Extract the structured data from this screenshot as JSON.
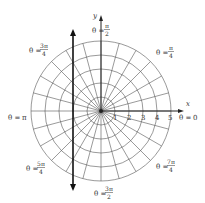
{
  "diagram": {
    "type": "polar-grid",
    "center": [
      101,
      111
    ],
    "unit_px": 14,
    "circles": [
      1,
      2,
      3,
      4,
      5
    ],
    "rays_count": 24,
    "x_axis_label": "x",
    "y_axis_label": "y",
    "radial_ticks": [
      "1",
      "2",
      "3",
      "4",
      "5"
    ],
    "line": {
      "equation": "x = -2",
      "x_value": -2
    },
    "angle_labels": {
      "zero": {
        "prefix": "θ =",
        "value": "0"
      },
      "pi_over_4": {
        "prefix": "θ =",
        "num": "π",
        "den": "4"
      },
      "pi_over_2": {
        "prefix": "θ =",
        "num": "π",
        "den": "2"
      },
      "three_pi_over_4": {
        "prefix": "θ =",
        "num": "3π",
        "den": "4"
      },
      "pi": {
        "prefix": "θ =",
        "value": "π"
      },
      "five_pi_over_4": {
        "prefix": "θ =",
        "num": "5π",
        "den": "4"
      },
      "three_pi_over_2": {
        "prefix": "θ =",
        "num": "3π",
        "den": "2"
      },
      "seven_pi_over_4": {
        "prefix": "θ =",
        "num": "7π",
        "den": "4"
      }
    },
    "colors": {
      "grid": "#555555",
      "axis": "#222222",
      "line": "#111111"
    }
  }
}
